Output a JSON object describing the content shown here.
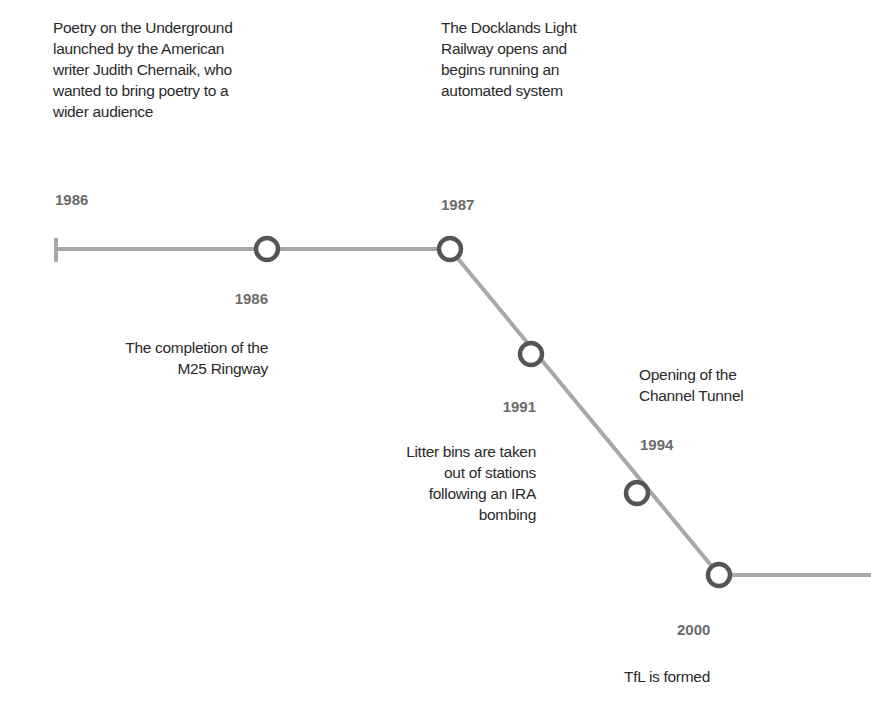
{
  "timeline": {
    "line_color": "#a8a8a8",
    "node_color": "#555555",
    "events": [
      {
        "year": "1986",
        "text": [
          "Poetry on the Underground",
          "launched by the American",
          "writer Judith Chernaik, who",
          "wanted to bring poetry to a",
          "wider audience"
        ]
      },
      {
        "year": "1986",
        "text": [
          "The completion of the",
          "M25 Ringway"
        ]
      },
      {
        "year": "1987",
        "text": [
          "The Docklands Light",
          "Railway opens and",
          "begins running an",
          "automated system"
        ]
      },
      {
        "year": "1991",
        "text": [
          "Litter bins are taken",
          "out of stations",
          "following an IRA",
          "bombing"
        ]
      },
      {
        "year": "1994",
        "text": [
          "Opening of the",
          "Channel Tunnel"
        ]
      },
      {
        "year": "2000",
        "text": [
          "TfL is formed"
        ]
      }
    ]
  }
}
